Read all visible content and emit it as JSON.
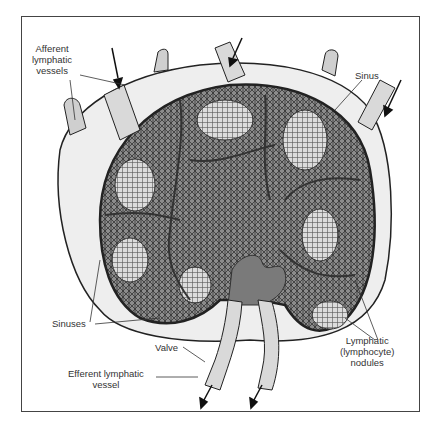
{
  "figure": {
    "colors": {
      "capsule_fill": "#eeeeee",
      "cortex_fill": "#6e6e6e",
      "medulla_fill": "#8a8a8a",
      "nodule_fill": "#d8d8d8",
      "outline": "#222222",
      "frame": "#444444"
    }
  },
  "labels": {
    "afferent": "Afferent\nlymphatic\nvessels",
    "sinus": "Sinus",
    "sinuses": "Sinuses",
    "valve": "Valve",
    "efferent": "Efferent lymphatic\nvessel",
    "nodules": "Lymphatic\n(lymphocyte)\nnodules"
  }
}
